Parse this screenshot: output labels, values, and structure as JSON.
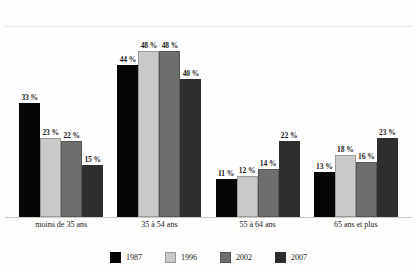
{
  "chart_data": {
    "type": "bar",
    "title": "",
    "title_truncated": true,
    "xlabel": "",
    "ylabel": "",
    "ylim": [
      0,
      55
    ],
    "grid": false,
    "legend_position": "bottom",
    "value_suffix": "%",
    "categories": [
      "moins de 35 ans",
      "35 à 54 ans",
      "55 à 64 ans",
      "65 ans et plus"
    ],
    "series": [
      {
        "name": "1987",
        "color": "#050505",
        "values": [
          33,
          44,
          11,
          13
        ],
        "labels": [
          "33 %",
          "44 %",
          "11 %",
          "13 %"
        ]
      },
      {
        "name": "1996",
        "color": "#c9c9c7",
        "values": [
          23,
          48,
          12,
          18
        ],
        "labels": [
          "23 %",
          "48 %",
          "12 %",
          "18 %"
        ]
      },
      {
        "name": "2002",
        "color": "#6e6e6c",
        "values": [
          22,
          48,
          14,
          16
        ],
        "labels": [
          "22 %",
          "48 %",
          "14 %",
          "16 %"
        ]
      },
      {
        "name": "2007",
        "color": "#2e2e2e",
        "values": [
          15,
          40,
          22,
          23
        ],
        "labels": [
          "15 %",
          "40 %",
          "22 %",
          "23 %"
        ]
      }
    ]
  }
}
